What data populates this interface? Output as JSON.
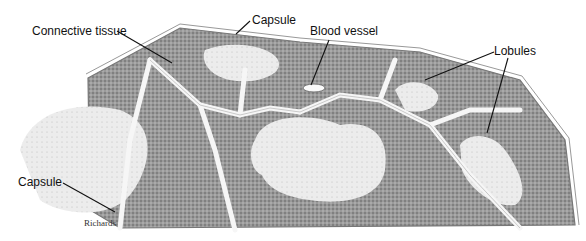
{
  "figure": {
    "labels": {
      "connective_tissue": "Connective tissue",
      "capsule_top": "Capsule",
      "blood_vessel": "Blood vessel",
      "lobules": "Lobules",
      "capsule_left": "Capsule"
    },
    "signature": "Richards"
  },
  "colors": {
    "cortex": "#8f8f8f",
    "medulla": "#e6e6e6",
    "septa": "#f4f4f4",
    "outline": "#777777",
    "leader": "#111111"
  }
}
